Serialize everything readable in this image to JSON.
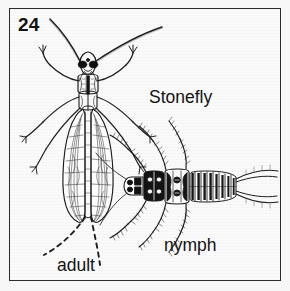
{
  "figure": {
    "number": "24",
    "common_name": "Stonefly",
    "stage_adult_label": "adult",
    "stage_nymph_label": "nymph",
    "border_color": "#2b2b2b",
    "background_color": "#fbfbfb",
    "ink_color": "#1a1a1a",
    "page_color": "#f7f7f7"
  },
  "specimens": [
    {
      "id": "adult",
      "label": "adult",
      "description": "winged adult stonefly, dorsal view, long antennae, two long cerci"
    },
    {
      "id": "nymph",
      "label": "nymph",
      "description": "aquatic stonefly nymph, dorsal view, bristled legs, segmented abdomen, two cerci"
    }
  ]
}
